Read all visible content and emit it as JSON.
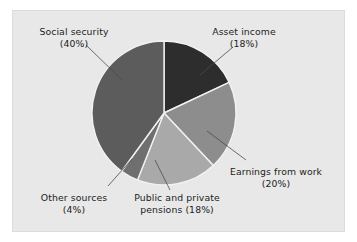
{
  "figure": {
    "panel_bg": "#e8e8e8",
    "page_bg": "#ffffff",
    "text_color": "#1c1c1c",
    "separator_color": "#f2f2f2",
    "leader_color": "#4a4a4a"
  },
  "chart_data": {
    "type": "pie",
    "title": "",
    "subtitle": "",
    "xlabel": "",
    "ylabel": "",
    "legend_position": "none",
    "grid": false,
    "units": "percent",
    "start_angle_deg": 0,
    "direction": "clockwise",
    "center": {
      "x": 164,
      "y": 113
    },
    "radius": 72,
    "categories": [
      "Asset income",
      "Earnings from work",
      "Public and private pensions",
      "Other sources",
      "Social security"
    ],
    "values": [
      18,
      20,
      18,
      4,
      40
    ],
    "colors": [
      "#2d2d2d",
      "#8d8d8d",
      "#a9a9a9",
      "#6f6f6f",
      "#5c5c5c"
    ],
    "slices": [
      {
        "name": "Asset income",
        "value": 18,
        "color": "#2d2d2d",
        "start_deg": 0,
        "end_deg": 64.8,
        "label_line1": "Asset income",
        "label_line2": "(18%)"
      },
      {
        "name": "Earnings from work",
        "value": 20,
        "color": "#8d8d8d",
        "start_deg": 64.8,
        "end_deg": 136.8,
        "label_line1": "Earnings from work",
        "label_line2": "(20%)"
      },
      {
        "name": "Public and private pensions",
        "value": 18,
        "color": "#a9a9a9",
        "start_deg": 136.8,
        "end_deg": 201.6,
        "label_line1": "Public and private",
        "label_line2": "pensions (18%)"
      },
      {
        "name": "Other sources",
        "value": 4,
        "color": "#6f6f6f",
        "start_deg": 201.6,
        "end_deg": 216.0,
        "label_line1": "Other sources",
        "label_line2": "(4%)"
      },
      {
        "name": "Social security",
        "value": 40,
        "color": "#5c5c5c",
        "start_deg": 216.0,
        "end_deg": 360.0,
        "label_line1": "Social security",
        "label_line2": "(40%)"
      }
    ]
  },
  "labels": {
    "social_security": {
      "line1": "Social security",
      "line2": "(40%)"
    },
    "asset_income": {
      "line1": "Asset income",
      "line2": "(18%)"
    },
    "earnings_from_work": {
      "line1": "Earnings from work",
      "line2": "(20%)"
    },
    "public_private_pensions": {
      "line1": "Public and private",
      "line2": "pensions (18%)"
    },
    "other_sources": {
      "line1": "Other sources",
      "line2": "(4%)"
    }
  }
}
